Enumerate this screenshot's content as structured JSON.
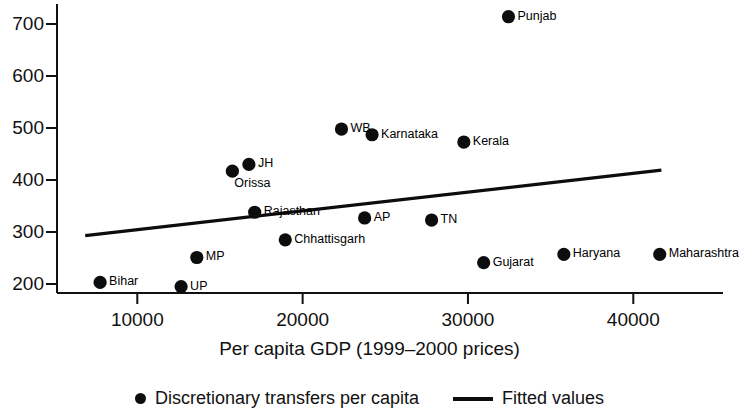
{
  "chart_data": {
    "type": "scatter",
    "title": "",
    "xlabel": "Per capita GDP (1999–2000 prices)",
    "ylabel": "",
    "xlim": [
      6000,
      43000
    ],
    "ylim": [
      180,
      730
    ],
    "xticks": [
      10000,
      20000,
      30000,
      40000
    ],
    "xtick_labels": [
      "10000",
      "20000",
      "30000",
      "40000"
    ],
    "yticks": [
      200,
      300,
      400,
      500,
      600,
      700
    ],
    "ytick_labels": [
      "200",
      "300",
      "400",
      "500",
      "600",
      "700"
    ],
    "grid": false,
    "legend_position": "bottom-center",
    "series": [
      {
        "name": "Discretionary transfers per capita",
        "type": "scatter",
        "marker": "circle",
        "color": "#0d0d0d",
        "points": [
          {
            "label": "Bihar",
            "x": 7750,
            "y": 203,
            "label_pos": "right"
          },
          {
            "label": "UP",
            "x": 12650,
            "y": 195,
            "label_pos": "right"
          },
          {
            "label": "MP",
            "x": 13600,
            "y": 251,
            "label_pos": "right"
          },
          {
            "label": "Orissa",
            "x": 15750,
            "y": 417,
            "label_pos": "below"
          },
          {
            "label": "JH",
            "x": 16750,
            "y": 430,
            "label_pos": "right"
          },
          {
            "label": "Rajasthan",
            "x": 17100,
            "y": 338,
            "label_pos": "right"
          },
          {
            "label": "Chhattisgarh",
            "x": 18950,
            "y": 285,
            "label_pos": "right"
          },
          {
            "label": "WB",
            "x": 22350,
            "y": 498,
            "label_pos": "right"
          },
          {
            "label": "AP",
            "x": 23750,
            "y": 327,
            "label_pos": "right"
          },
          {
            "label": "Karnataka",
            "x": 24200,
            "y": 487,
            "label_pos": "right"
          },
          {
            "label": "TN",
            "x": 27800,
            "y": 323,
            "label_pos": "right"
          },
          {
            "label": "Kerala",
            "x": 29750,
            "y": 473,
            "label_pos": "right"
          },
          {
            "label": "Gujarat",
            "x": 30950,
            "y": 241,
            "label_pos": "right"
          },
          {
            "label": "Punjab",
            "x": 32450,
            "y": 714,
            "label_pos": "right"
          },
          {
            "label": "Haryana",
            "x": 35800,
            "y": 257,
            "label_pos": "right"
          },
          {
            "label": "Maharashtra",
            "x": 41600,
            "y": 257,
            "label_pos": "right"
          }
        ]
      },
      {
        "name": "Fitted values",
        "type": "line",
        "color": "#0d0d0d",
        "x": [
          6850,
          41700
        ],
        "y": [
          293,
          419
        ]
      }
    ]
  },
  "legend": {
    "items": [
      {
        "label": "Discretionary transfers per capita",
        "marker": "dot-marker-icon"
      },
      {
        "label": "Fitted values",
        "marker": "line-marker-icon"
      }
    ]
  },
  "axis": {
    "x_title": "Per capita GDP (1999–2000 prices)"
  }
}
